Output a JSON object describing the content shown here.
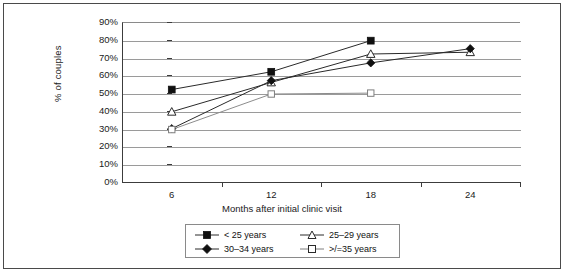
{
  "chart_data": {
    "type": "line",
    "title": "",
    "xlabel": "Months after initial clinic visit",
    "ylabel": "% of couples",
    "categories": [
      "6",
      "12",
      "18",
      "24"
    ],
    "x": [
      6,
      12,
      18,
      24
    ],
    "ylim": [
      0,
      90
    ],
    "ytick_labels": [
      "0%",
      "10%",
      "20%",
      "30%",
      "40%",
      "50%",
      "60%",
      "70%",
      "80%",
      "90%"
    ],
    "ytick_values": [
      0,
      10,
      20,
      30,
      40,
      50,
      60,
      70,
      80,
      90
    ],
    "grid": "horizontal",
    "legend_position": "bottom",
    "series": [
      {
        "name": "< 25 years",
        "marker": "filled-square",
        "values": [
          52,
          62,
          79.5,
          null
        ]
      },
      {
        "name": "25–29 years",
        "marker": "open-triangle",
        "values": [
          39.5,
          56,
          72,
          73
        ]
      },
      {
        "name": "30–34 years",
        "marker": "filled-diamond",
        "values": [
          30,
          57,
          67,
          75
        ]
      },
      {
        "name": ">/=35 years",
        "marker": "open-square",
        "values": [
          29.5,
          49.5,
          50,
          null
        ]
      }
    ]
  },
  "axes": {
    "y_title": "% of couples",
    "x_title": "Months after initial clinic visit",
    "y_ticks": [
      "90%",
      "80%",
      "70%",
      "60%",
      "50%",
      "40%",
      "30%",
      "20%",
      "10%",
      "0%"
    ],
    "x_ticks": [
      "6",
      "12",
      "18",
      "24"
    ]
  },
  "legend": {
    "items": [
      {
        "label": "< 25 years",
        "marker": "filled-square"
      },
      {
        "label": "25–29 years",
        "marker": "open-triangle"
      },
      {
        "label": "30–34 years",
        "marker": "filled-diamond"
      },
      {
        "label": ">/=35 years",
        "marker": "open-square"
      }
    ]
  }
}
